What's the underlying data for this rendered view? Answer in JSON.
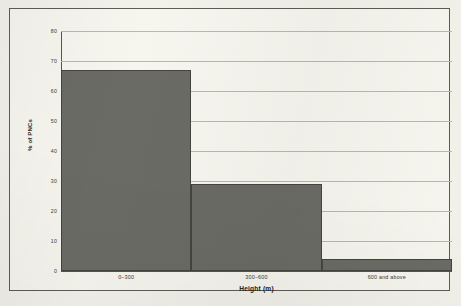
{
  "chart_data": {
    "type": "bar",
    "title": "",
    "subtitle": "",
    "categories": [
      "0–300",
      "300–600",
      "600 and above"
    ],
    "values": [
      67,
      29,
      4
    ],
    "xlabel": "Height (m)",
    "ylabel": "% of PNCs",
    "ylim": [
      0,
      80
    ],
    "ytick_labels": [
      "0",
      "10",
      "20",
      "30",
      "40",
      "50",
      "60",
      "70",
      "80"
    ],
    "ytick_values": [
      0,
      10,
      20,
      30,
      40,
      50,
      60,
      70,
      80
    ],
    "grid": "horizontal",
    "legend": "none",
    "bar_color": "#6b6b66",
    "bar_edge_color": "#45443f",
    "gridline_color": "#b9b8ae",
    "axis_color": "#57564e",
    "background_color": "#f6f5ee",
    "frame_color": "#5d5d55"
  }
}
